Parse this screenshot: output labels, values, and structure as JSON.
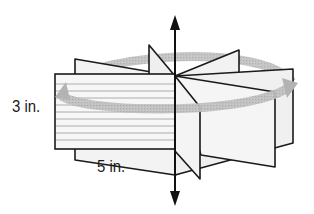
{
  "figure": {
    "labels": {
      "height": "3 in.",
      "width": "5 in."
    },
    "dimensions": {
      "height_in": 3,
      "width_in": 5
    },
    "colors": {
      "outline": "#1a1a1a",
      "panel_fill": "#f4f4f4",
      "front_panel_fill": "#f7f7f7",
      "rule_lines": "#9a9a9a",
      "rotation_arrow": "#b5b5b5",
      "axis": "#111111"
    }
  }
}
